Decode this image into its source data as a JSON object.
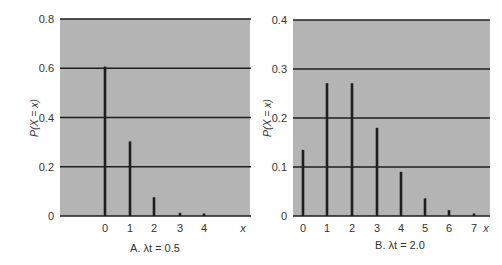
{
  "colors": {
    "plot_bg": "#b4b4b4",
    "grid": "#1e1e1e",
    "bar": "#1e1e1e",
    "text": "#333333"
  },
  "chart_data": [
    {
      "type": "bar",
      "title": "A. λt = 0.5",
      "xlabel": "x",
      "ylabel": "P(X = x)",
      "categories": [
        "0",
        "1",
        "2",
        "3",
        "4"
      ],
      "values": [
        0.607,
        0.303,
        0.076,
        0.013,
        0.002
      ],
      "ylim": [
        0,
        0.8
      ],
      "yticks": [
        "0",
        "0.2",
        "0.4",
        "0.6",
        "0.8"
      ],
      "grid": true,
      "legend": null
    },
    {
      "type": "bar",
      "title": "B. λt = 2.0",
      "xlabel": "x",
      "ylabel": "P(X = x)",
      "categories": [
        "0",
        "1",
        "2",
        "3",
        "4",
        "5",
        "6",
        "7"
      ],
      "values": [
        0.135,
        0.271,
        0.271,
        0.18,
        0.09,
        0.036,
        0.012,
        0.003
      ],
      "ylim": [
        0,
        0.4
      ],
      "yticks": [
        "0",
        "0.1",
        "0.2",
        "0.3",
        "0.4"
      ],
      "grid": true,
      "legend": null
    }
  ]
}
